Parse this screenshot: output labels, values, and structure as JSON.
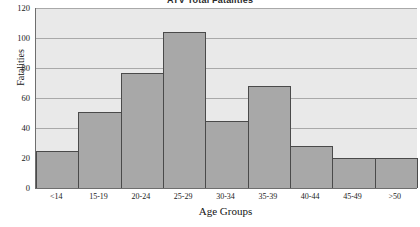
{
  "chart_data": {
    "type": "bar",
    "title": "ATV Total Fatalities",
    "xlabel": "Age Groups",
    "ylabel": "Fatalities",
    "categories": [
      "<14",
      "15-19",
      "20-24",
      "25-29",
      "30-34",
      "35-39",
      "40-44",
      "45-49",
      ">50"
    ],
    "values": [
      25,
      51,
      77,
      104,
      45,
      68,
      28,
      20,
      20
    ],
    "ylim": [
      0,
      120
    ],
    "yticks": [
      0,
      20,
      40,
      60,
      80,
      100,
      120
    ],
    "ytick_labels": [
      "0",
      "20",
      "40",
      "60",
      "80",
      "100",
      "120"
    ],
    "grid": true,
    "legend": false,
    "bar_color": "#a8a8a8",
    "bar_edge_color": "#4a4a4a",
    "plot_background": "#e9e9e9",
    "gridline_color": "#a9a9a9",
    "axis_color": "#6e6e6e"
  }
}
